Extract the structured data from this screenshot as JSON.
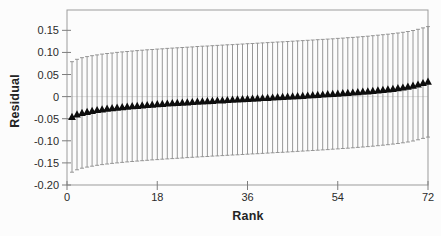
{
  "chart_data": {
    "type": "scatter",
    "title": "",
    "xlabel": "Rank",
    "ylabel": "Residual",
    "xlim": [
      0,
      72
    ],
    "ylim": [
      -0.2,
      0.196
    ],
    "xticks": [
      0,
      18,
      36,
      54,
      72
    ],
    "xtick_labels": [
      "0",
      "18",
      "36",
      "54",
      "72"
    ],
    "yticks": [
      0.15,
      0.1,
      0.05,
      0,
      -0.05,
      -0.1,
      -0.15,
      -0.2
    ],
    "ytick_labels": [
      "0.15",
      "0.10",
      "0.05",
      "0",
      "-0.05",
      "-0.10",
      "-0.15",
      "-0.20"
    ],
    "grid": false,
    "legend": null,
    "zero_line": true,
    "marker": "filled-triangle-up",
    "x_first": 1,
    "x_step": 1,
    "error_half_width": 0.125,
    "values": [
      -0.046,
      -0.0405,
      -0.037,
      -0.0345,
      -0.0324,
      -0.0305,
      -0.0289,
      -0.0275,
      -0.0262,
      -0.025,
      -0.0239,
      -0.0228,
      -0.0218,
      -0.0209,
      -0.02,
      -0.0191,
      -0.0183,
      -0.0175,
      -0.0167,
      -0.0159,
      -0.0152,
      -0.0145,
      -0.0138,
      -0.0131,
      -0.0124,
      -0.0117,
      -0.011,
      -0.0104,
      -0.0097,
      -0.0091,
      -0.0085,
      -0.0078,
      -0.0072,
      -0.0066,
      -0.0059,
      -0.0053,
      -0.0047,
      -0.0041,
      -0.0034,
      -0.0028,
      -0.0022,
      -0.0015,
      -0.0009,
      -0.0003,
      0.0004,
      0.001,
      0.0017,
      0.0024,
      0.0031,
      0.0038,
      0.0045,
      0.0052,
      0.0059,
      0.0067,
      0.0075,
      0.0083,
      0.0091,
      0.01,
      0.0109,
      0.0118,
      0.0128,
      0.0139,
      0.015,
      0.0162,
      0.0175,
      0.0189,
      0.0205,
      0.0224,
      0.0246,
      0.0273,
      0.0305,
      0.0335
    ],
    "colors": {
      "marker": "#0d0d0d",
      "error_bar": "#8c8c8c",
      "plot_border": "#9b9b9b",
      "zero_line": "#dedede",
      "tick": "#7d7d7d",
      "text": "#2b2b2b"
    }
  }
}
